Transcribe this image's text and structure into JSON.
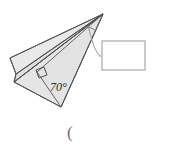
{
  "figure": {
    "background_color": "#ffffff",
    "plane": {
      "fill_color": "#e9e9e9",
      "fill_color_shaded": "#dedede",
      "outline_color": "#555555",
      "outline_width": 1
    },
    "labels": {
      "angle_value": "70°",
      "open_paren": "("
    },
    "answer_box": {
      "value": "",
      "placeholder": "",
      "border_color": "#b5b5b5",
      "fill_color": "#ffffff"
    },
    "markers": {
      "right_angle_marker": "right-angle-square",
      "apex_arc_marker": "angle-arc",
      "leader_line": "leader-line"
    }
  }
}
